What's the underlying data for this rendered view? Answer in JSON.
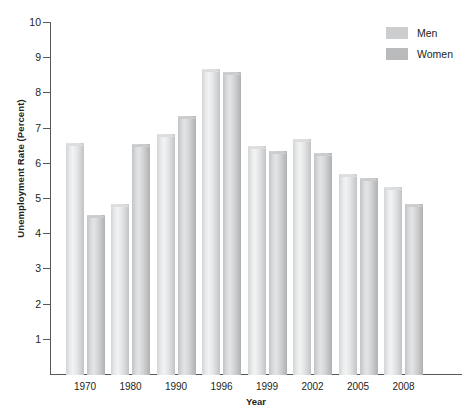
{
  "chart_data": {
    "type": "bar",
    "title": "",
    "xlabel": "Year",
    "ylabel": "Unemployment Rate (Percent)",
    "categories": [
      "1970",
      "1980",
      "1990",
      "1996",
      "1999",
      "2002",
      "2005",
      "2008"
    ],
    "series": [
      {
        "name": "Men",
        "color": "#dcdddf",
        "values": [
          6.6,
          4.85,
          6.85,
          8.7,
          6.5,
          6.7,
          5.7,
          5.35
        ]
      },
      {
        "name": "Women",
        "color": "#c4c5c7",
        "values": [
          4.55,
          6.55,
          7.35,
          8.6,
          6.35,
          6.3,
          5.6,
          4.85
        ]
      }
    ],
    "ylim": [
      0,
      10
    ],
    "yticks": [
      1,
      2,
      3,
      4,
      5,
      6,
      7,
      8,
      9,
      10
    ],
    "ytick_labels": [
      "1",
      "2",
      "3",
      "4",
      "5",
      "6",
      "7",
      "8",
      "9",
      "10"
    ],
    "grid": false,
    "legend_position": "top-right"
  },
  "legend": {
    "items": [
      {
        "label": "Men"
      },
      {
        "label": "Women"
      }
    ]
  },
  "axes": {
    "x_title": "Year",
    "y_title": "Unemployment Rate (Percent)"
  }
}
